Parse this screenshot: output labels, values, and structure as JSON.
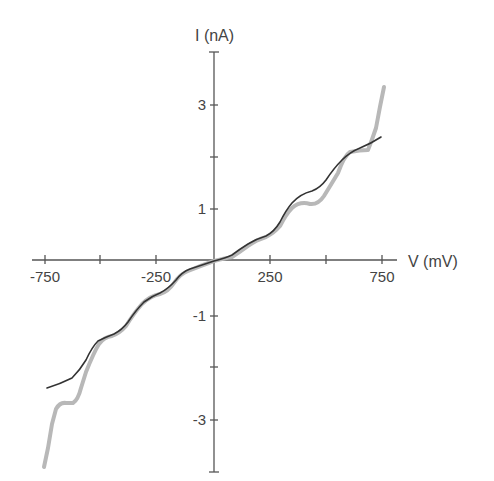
{
  "chart_data": {
    "type": "line",
    "title": "",
    "xlabel": "V (mV)",
    "ylabel": "I (nA)",
    "xlim": [
      -800,
      800
    ],
    "ylim": [
      -4,
      4
    ],
    "grid": false,
    "legend": null,
    "x_ticks": [
      -750,
      -500,
      -250,
      0,
      250,
      500,
      750
    ],
    "x_tick_labels": [
      "-750",
      "",
      "-250",
      "",
      "250",
      "",
      "750"
    ],
    "y_ticks": [
      -4,
      -3,
      -2,
      -1,
      0,
      1,
      2,
      3,
      4
    ],
    "y_tick_labels": [
      "",
      "-3",
      "",
      "-1",
      "",
      "1",
      "",
      "3",
      ""
    ],
    "series": [
      {
        "name": "light gray (thick) curve",
        "color": "#b8b8b8",
        "x": [
          -740,
          -700,
          -660,
          -620,
          -560,
          -500,
          -420,
          -330,
          -250,
          -150,
          -60,
          0,
          60,
          150,
          220,
          280,
          330,
          400,
          460,
          520,
          570,
          620,
          680,
          720,
          750
        ],
        "y": [
          -4.0,
          -3.3,
          -2.7,
          -2.7,
          -2.3,
          -1.5,
          -1.3,
          -0.9,
          -0.6,
          -0.35,
          -0.1,
          0.0,
          0.05,
          0.35,
          0.45,
          0.65,
          0.95,
          1.05,
          1.1,
          1.55,
          2.05,
          2.05,
          2.3,
          2.9,
          3.4
        ]
      },
      {
        "name": "dark (thin) curve",
        "color": "#333333",
        "x": [
          -740,
          -650,
          -600,
          -550,
          -500,
          -420,
          -330,
          -250,
          -150,
          -60,
          0,
          60,
          150,
          220,
          280,
          330,
          400,
          460,
          520,
          570,
          620,
          680,
          730
        ],
        "y": [
          -2.45,
          -2.15,
          -1.8,
          -1.55,
          -1.45,
          -1.3,
          -0.85,
          -0.55,
          -0.4,
          -0.15,
          0.0,
          0.05,
          0.3,
          0.45,
          0.7,
          1.1,
          1.35,
          1.45,
          1.8,
          2.15,
          2.3,
          2.35,
          2.45
        ]
      }
    ]
  },
  "render": {
    "width": 494,
    "height": 481,
    "origin_px": [
      214,
      260
    ],
    "x_tick_px": [
      45,
      100,
      156,
      214,
      270,
      326,
      382
    ],
    "y_tick_px": [
      472,
      420,
      367,
      316,
      260,
      209,
      157,
      105,
      52
    ],
    "gray_path": "M 44 467 L 48 448 L 52 424 L 56 409 Q 60 402 66 403 L 73 403 Q 78 400 81 388 L 86 372 Q 94 352 99 344 Q 104 337 112 336 Q 120 333 126 326 Q 134 313 142 304 Q 150 296 160 294 Q 168 292 174 283 Q 180 274 188 271 Q 200 266 214 261 Q 226 258 232 257 Q 240 252 248 246 Q 256 240 266 237 Q 274 233 280 226 Q 286 214 292 208 Q 300 201 310 204 Q 318 205 324 196 Q 332 183 338 173 Q 344 156 350 152 Q 360 150 368 150 Q 372 140 376 128 Q 380 106 384 87",
    "dark_path": "M 47 388 Q 60 384 72 378 Q 80 370 86 360 Q 92 347 98 341 Q 106 337 114 334 Q 122 330 128 322 Q 136 310 144 302 Q 152 296 160 293 Q 168 289 176 280 Q 182 272 190 269 Q 202 265 214 261 Q 226 258 232 255 Q 240 249 248 244 Q 256 239 266 236 Q 274 232 280 222 Q 286 210 292 203 Q 300 194 312 191 Q 320 188 326 180 Q 334 168 342 160 Q 350 152 360 148 Q 372 143 381 137",
    "y_axis": {
      "x": 214,
      "top": 52,
      "bottom": 472,
      "cap_half": 5
    },
    "x_axis": {
      "y": 260,
      "left": 32,
      "right": 397
    },
    "xlabel_pos": [
      408,
      267
    ],
    "ylabel_pos": [
      195,
      41
    ]
  }
}
